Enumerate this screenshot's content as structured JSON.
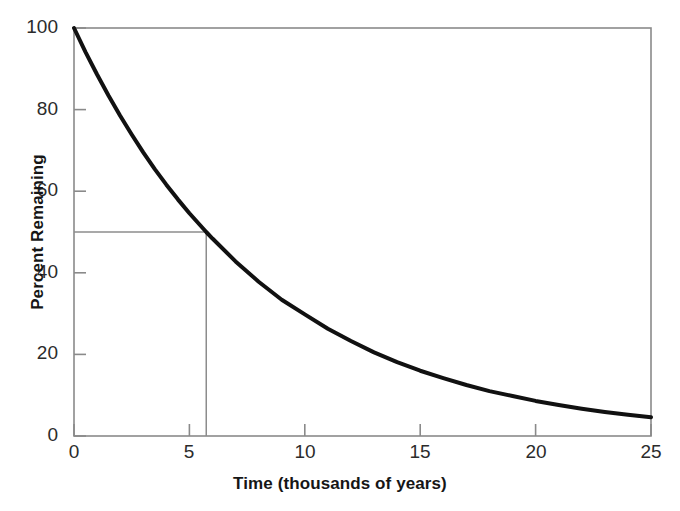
{
  "chart_data": {
    "type": "line",
    "title": "",
    "xlabel": "Time (thousands of years)",
    "ylabel": "Percent Remaining",
    "xlim": [
      0,
      25
    ],
    "ylim": [
      0,
      100
    ],
    "xticks": [
      0,
      5,
      10,
      15,
      20,
      25
    ],
    "xtick_labels": [
      "0",
      "5",
      "10",
      "15",
      "20",
      "25"
    ],
    "yticks": [
      0,
      20,
      40,
      60,
      80,
      100
    ],
    "ytick_labels": [
      "0",
      "20",
      "40",
      "60",
      "80",
      "100"
    ],
    "grid": false,
    "legend": null,
    "series": [
      {
        "name": "Percent Remaining",
        "style": "solid",
        "color": "#111111",
        "linewidth": 4,
        "x": [
          0,
          0.5,
          1,
          1.5,
          2,
          2.5,
          3,
          3.5,
          4,
          4.5,
          5,
          5.73,
          6,
          7,
          8,
          9,
          10,
          11,
          12,
          13,
          14,
          15,
          16,
          17,
          18,
          19,
          20,
          21,
          22,
          23,
          24,
          25
        ],
        "y": [
          100,
          94.1,
          88.6,
          83.4,
          78.5,
          73.9,
          69.5,
          65.4,
          61.6,
          58.0,
          54.6,
          50.0,
          48.4,
          42.8,
          37.8,
          33.4,
          29.8,
          26.3,
          23.3,
          20.5,
          18.1,
          16.0,
          14.2,
          12.5,
          11.0,
          9.8,
          8.6,
          7.6,
          6.7,
          5.9,
          5.2,
          4.6
        ],
        "model": "exponential decay, half-life 5.73 thousand years"
      }
    ],
    "annotations": [
      {
        "name": "half-life-guide-horizontal",
        "type": "segment",
        "label": "50 percent level",
        "x0": 0,
        "y0": 50,
        "x1": 5.73,
        "y1": 50,
        "color": "#8c8c8c"
      },
      {
        "name": "half-life-guide-vertical",
        "type": "segment",
        "label": "half-life at about 5.7 thousand years",
        "x0": 5.73,
        "y0": 50,
        "x1": 5.73,
        "y1": 0,
        "color": "#8c8c8c"
      }
    ],
    "frame": {
      "color": "#8a8a8a",
      "sides": [
        "left",
        "right",
        "top",
        "bottom"
      ]
    }
  }
}
